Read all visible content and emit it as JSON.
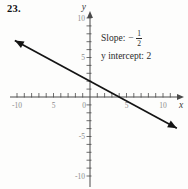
{
  "page": {
    "problem_number": "23."
  },
  "annotation": {
    "slope_label": "Slope:",
    "slope_sign": "−",
    "slope_numerator": "1",
    "slope_denominator": "2",
    "intercept_label": "y intercept:",
    "intercept_value": "2"
  },
  "chart_data": {
    "type": "line",
    "title": "",
    "xlabel": "x",
    "ylabel": "y",
    "xlim": [
      -11,
      12
    ],
    "ylim": [
      -11.5,
      11
    ],
    "grid": false,
    "x_tick_step": 1,
    "y_tick_step": 1,
    "x_tick_range": [
      -10,
      11
    ],
    "y_tick_range": [
      -10,
      10
    ],
    "x_tick_labels": [
      {
        "value": -10,
        "label": "-10"
      },
      {
        "value": -5,
        "label": "5"
      },
      {
        "value": 0,
        "label": "0"
      },
      {
        "value": 5,
        "label": "5"
      },
      {
        "value": 10,
        "label": "10"
      }
    ],
    "y_tick_labels": [
      {
        "value": 10,
        "label": "10"
      },
      {
        "value": 5,
        "label": "5"
      },
      {
        "value": -5,
        "label": "-5"
      },
      {
        "value": -10,
        "label": "-10"
      }
    ],
    "series": [
      {
        "name": "line-slope-neg-one-half-intercept-2",
        "slope": -0.5,
        "y_intercept": 2,
        "x_start": -10.3,
        "x_end": 11.9,
        "arrows_both_ends": true,
        "points": [
          [
            -10,
            7
          ],
          [
            0,
            2
          ],
          [
            4,
            0
          ],
          [
            10,
            -3
          ]
        ]
      }
    ],
    "colors": {
      "line": "#141414",
      "axis": "#4a4a4a",
      "tick_labels": "#8b8b8b",
      "axis_letter": "#3a3a3a"
    }
  }
}
